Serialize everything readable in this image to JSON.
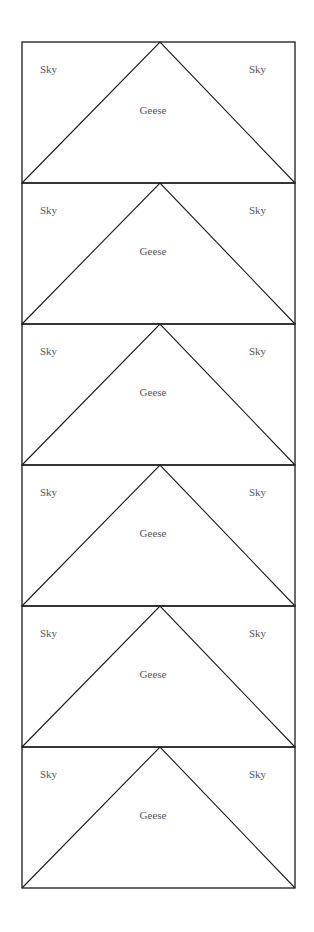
{
  "diagram": {
    "frame": {
      "left": 22,
      "right": 295,
      "top": 42,
      "block_height": 141
    },
    "stroke_color": "#1a1a1a",
    "text_color": "#555555",
    "blocks": [
      {
        "left_label": "Sky",
        "center_label": "Geese",
        "right_label": "Sky"
      },
      {
        "left_label": "Sky",
        "center_label": "Geese",
        "right_label": "Sky"
      },
      {
        "left_label": "Sky",
        "center_label": "Geese",
        "right_label": "Sky"
      },
      {
        "left_label": "Sky",
        "center_label": "Geese",
        "right_label": "Sky"
      },
      {
        "left_label": "Sky",
        "center_label": "Geese",
        "right_label": "Sky"
      },
      {
        "left_label": "Sky",
        "center_label": "Geese",
        "right_label": "Sky"
      }
    ]
  }
}
